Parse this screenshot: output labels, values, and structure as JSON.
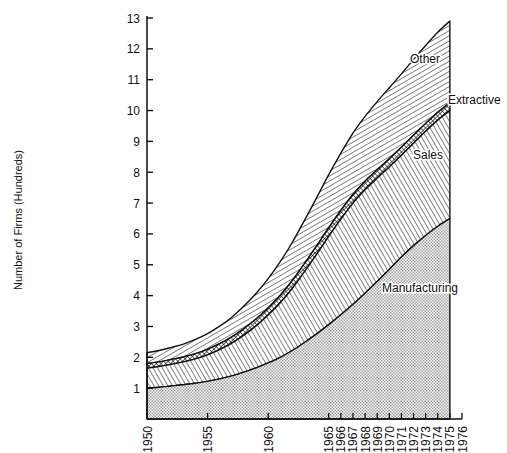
{
  "chart_data": {
    "type": "area",
    "stacked": true,
    "title": "",
    "xlabel": "",
    "ylabel": "Number of Firms (Hundreds)",
    "xlim": [
      1950,
      1976
    ],
    "ylim": [
      0,
      13
    ],
    "grid": false,
    "legend_position": "inline-labels",
    "x_tick_labels": [
      "1950",
      "1955",
      "1960",
      "1965",
      "1966",
      "1967",
      "1968",
      "1969",
      "1970",
      "1971",
      "1972",
      "1973",
      "1974",
      "1975",
      "1976"
    ],
    "x_tick_values": [
      1950,
      1955,
      1960,
      1965,
      1966,
      1967,
      1968,
      1969,
      1970,
      1971,
      1972,
      1973,
      1974,
      1975,
      1976
    ],
    "y_tick_labels": [
      "1",
      "2",
      "3",
      "4",
      "5",
      "6",
      "7",
      "8",
      "9",
      "10",
      "11",
      "12",
      "13"
    ],
    "y_tick_values": [
      1,
      2,
      3,
      4,
      5,
      6,
      7,
      8,
      9,
      10,
      11,
      12,
      13
    ],
    "x": [
      1950,
      1951,
      1952,
      1953,
      1954,
      1955,
      1956,
      1957,
      1958,
      1959,
      1960,
      1961,
      1962,
      1963,
      1964,
      1965,
      1966,
      1967,
      1968,
      1969,
      1970,
      1971,
      1972,
      1973,
      1974,
      1975
    ],
    "series": [
      {
        "name": "Manufacturing",
        "fill": "stipple-dots",
        "values": [
          1.0,
          1.03,
          1.07,
          1.11,
          1.16,
          1.22,
          1.3,
          1.4,
          1.52,
          1.66,
          1.82,
          2.0,
          2.22,
          2.48,
          2.76,
          3.06,
          3.38,
          3.72,
          4.08,
          4.46,
          4.85,
          5.25,
          5.62,
          5.95,
          6.25,
          6.5
        ]
      },
      {
        "name": "Sales",
        "fill": "diagonal-hatch-down",
        "values": [
          0.65,
          0.67,
          0.7,
          0.74,
          0.79,
          0.86,
          0.95,
          1.06,
          1.2,
          1.36,
          1.55,
          1.77,
          2.02,
          2.3,
          2.58,
          2.86,
          3.1,
          3.28,
          3.35,
          3.35,
          3.32,
          3.3,
          3.32,
          3.38,
          3.44,
          3.5
        ]
      },
      {
        "name": "Extractive",
        "fill": "cross-hatch",
        "values": [
          0.15,
          0.15,
          0.16,
          0.16,
          0.17,
          0.18,
          0.19,
          0.2,
          0.21,
          0.22,
          0.23,
          0.24,
          0.25,
          0.26,
          0.27,
          0.28,
          0.28,
          0.28,
          0.28,
          0.27,
          0.27,
          0.26,
          0.26,
          0.25,
          0.25,
          0.25
        ]
      },
      {
        "name": "Other",
        "fill": "diagonal-hatch-up",
        "values": [
          0.35,
          0.37,
          0.39,
          0.42,
          0.46,
          0.51,
          0.57,
          0.64,
          0.73,
          0.83,
          0.95,
          1.09,
          1.24,
          1.4,
          1.56,
          1.72,
          1.86,
          1.99,
          2.1,
          2.21,
          2.3,
          2.38,
          2.46,
          2.53,
          2.6,
          2.65
        ]
      }
    ],
    "cumulative_tops": {
      "Manufacturing": [
        1.0,
        1.03,
        1.07,
        1.11,
        1.16,
        1.22,
        1.3,
        1.4,
        1.52,
        1.66,
        1.82,
        2.0,
        2.22,
        2.48,
        2.76,
        3.06,
        3.38,
        3.72,
        4.08,
        4.46,
        4.85,
        5.25,
        5.62,
        5.95,
        6.25,
        6.5
      ],
      "Sales": [
        1.65,
        1.7,
        1.77,
        1.85,
        1.95,
        2.08,
        2.25,
        2.46,
        2.72,
        3.02,
        3.37,
        3.77,
        4.24,
        4.78,
        5.34,
        5.92,
        6.48,
        7.0,
        7.43,
        7.81,
        8.17,
        8.55,
        8.94,
        9.33,
        9.69,
        10.0
      ],
      "Extractive": [
        1.8,
        1.85,
        1.93,
        2.01,
        2.12,
        2.26,
        2.44,
        2.66,
        2.93,
        3.24,
        3.6,
        4.01,
        4.49,
        5.04,
        5.61,
        6.2,
        6.76,
        7.28,
        7.71,
        8.08,
        8.44,
        8.81,
        9.2,
        9.58,
        9.94,
        10.25
      ],
      "Other": [
        2.15,
        2.22,
        2.32,
        2.43,
        2.58,
        2.77,
        3.01,
        3.3,
        3.66,
        4.07,
        4.55,
        5.1,
        5.73,
        6.44,
        7.17,
        7.92,
        8.62,
        9.27,
        9.81,
        10.29,
        10.74,
        11.19,
        11.66,
        12.11,
        12.54,
        12.9
      ]
    },
    "band_labels": [
      {
        "name": "Other",
        "text": "Other",
        "x": 410,
        "y": 63
      },
      {
        "name": "Extractive",
        "text": "Extractive",
        "x": 448,
        "y": 104
      },
      {
        "name": "Sales",
        "text": "Sales",
        "x": 413,
        "y": 159
      },
      {
        "name": "Manufacturing",
        "text": "Manufacturing",
        "x": 382,
        "y": 292
      }
    ]
  },
  "colors": {
    "ink": "#111111",
    "background": "#ffffff",
    "manufacturing_fill": "#d8d8d8",
    "sales_fill": "#9a9a9a",
    "extractive_fill": "#4a4a4a",
    "other_fill": "#bdbdbd"
  }
}
